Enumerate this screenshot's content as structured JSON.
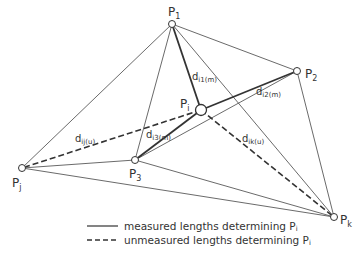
{
  "diagram": {
    "points": {
      "P1": {
        "label": "P",
        "sub": "1",
        "x": 172,
        "y": 24
      },
      "P2": {
        "label": "P",
        "sub": "2",
        "x": 297,
        "y": 71
      },
      "P3": {
        "label": "P",
        "sub": "3",
        "x": 135,
        "y": 160
      },
      "Pi": {
        "label": "P",
        "sub": "i",
        "x": 201,
        "y": 110
      },
      "Pj": {
        "label": "P",
        "sub": "j",
        "x": 22,
        "y": 168
      },
      "Pk": {
        "label": "P",
        "sub": "k",
        "x": 334,
        "y": 217
      }
    },
    "distances": {
      "d_i1": {
        "label": "d",
        "sub": "i1(m)"
      },
      "d_i2": {
        "label": "d",
        "sub": "i2(m)"
      },
      "d_i3": {
        "label": "d",
        "sub": "i3(m)"
      },
      "d_ij": {
        "label": "d",
        "sub": "ij(u)"
      },
      "d_ik": {
        "label": "d",
        "sub": "ik(u)"
      }
    },
    "line_color": "#333333"
  },
  "legend": {
    "measured": {
      "text": "measured lengths determining P",
      "sub": "i"
    },
    "unmeasured": {
      "text": "unmeasured lengths determining P",
      "sub": "i"
    }
  }
}
